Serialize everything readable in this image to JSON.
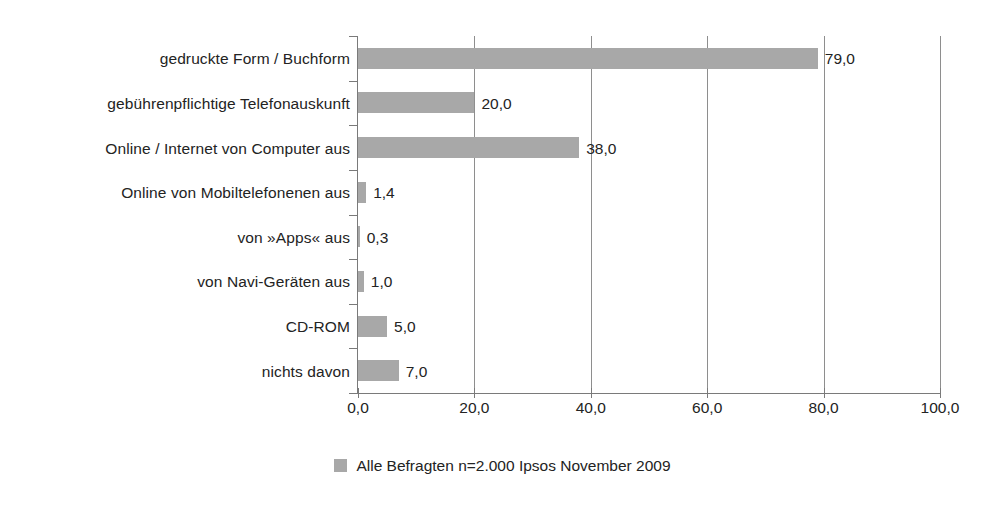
{
  "chart_data": {
    "type": "bar",
    "orientation": "horizontal",
    "title": "",
    "subtitle": "",
    "xlabel": "",
    "ylabel": "",
    "xlim": [
      0,
      100
    ],
    "grid": true,
    "gridlines_x": [
      20,
      40,
      60,
      80,
      100
    ],
    "legend_position": "bottom-center",
    "categories": [
      "gedruckte Form / Buchform",
      "gebührenpflichtige Telefonauskunft",
      "Online / Internet von Computer aus",
      "Online von Mobiltelefonenen aus",
      "von »Apps« aus",
      "von Navi-Geräten aus",
      "CD-ROM",
      "nichts davon"
    ],
    "values": [
      79.0,
      20.0,
      38.0,
      1.4,
      0.3,
      1.0,
      5.0,
      7.0
    ],
    "value_labels": [
      "79,0",
      "20,0",
      "38,0",
      "1,4",
      "0,3",
      "1,0",
      "5,0",
      "7,0"
    ],
    "xticks": [
      0,
      20,
      40,
      60,
      80,
      100
    ],
    "xtick_labels": [
      "0,0",
      "20,0",
      "40,0",
      "60,0",
      "80,0",
      "100,0"
    ],
    "series": [
      {
        "name": "Alle Befragten n=2.000 Ipsos November 2009",
        "color": "#a8a8a8",
        "values": [
          79.0,
          20.0,
          38.0,
          1.4,
          0.3,
          1.0,
          5.0,
          7.0
        ]
      }
    ],
    "legend": [
      {
        "label": "Alle Befragten n=2.000 Ipsos November 2009",
        "color": "#a8a8a8"
      }
    ],
    "colors": {
      "bar": "#a8a8a8",
      "axis": "#7a7a7a",
      "grid": "#8e8e8e",
      "text": "#232323",
      "background": "#ffffff"
    }
  }
}
